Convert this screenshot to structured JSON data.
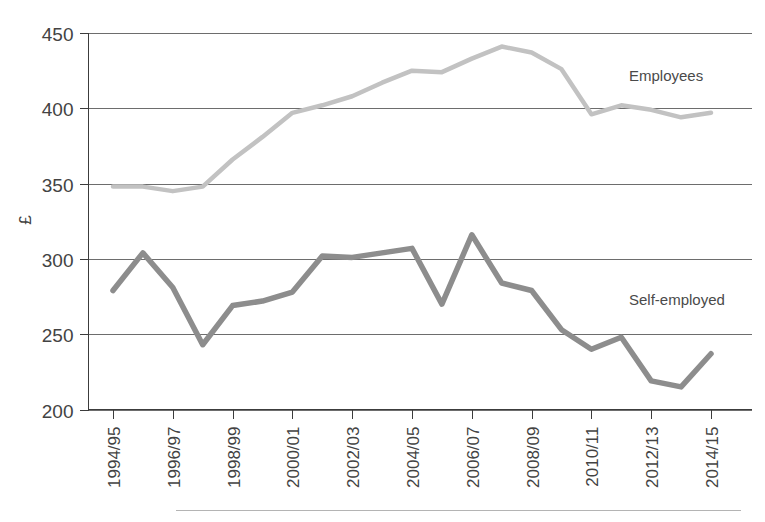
{
  "chart_data": {
    "type": "line",
    "title": "",
    "xlabel": "",
    "ylabel": "£",
    "ylim": [
      200,
      450
    ],
    "yticks": [
      200,
      250,
      300,
      350,
      400,
      450
    ],
    "grid": true,
    "legend_position": "inline-right",
    "x": [
      "1994/95",
      "1995/96",
      "1996/97",
      "1997/98",
      "1998/99",
      "1999/00",
      "2000/01",
      "2001/02",
      "2002/03",
      "2003/04",
      "2004/05",
      "2005/06",
      "2006/07",
      "2007/08",
      "2008/09",
      "2009/10",
      "2010/11",
      "2011/12",
      "2012/13",
      "2013/14",
      "2014/15"
    ],
    "xtick_labels": [
      "1994/95",
      "1996/97",
      "1998/99",
      "2000/01",
      "2002/03",
      "2004/05",
      "2006/07",
      "2008/09",
      "2010/11",
      "2012/13",
      "2014/15"
    ],
    "series": [
      {
        "name": "Employees",
        "color": "#c2c2c2",
        "stroke_width": 4.5,
        "values": [
          348,
          348,
          345,
          348,
          366,
          381,
          397,
          402,
          408,
          417,
          425,
          424,
          433,
          441,
          437,
          426,
          396,
          402,
          399,
          394,
          397
        ]
      },
      {
        "name": "Self-employed",
        "color": "#8d8d8d",
        "stroke_width": 5.5,
        "values": [
          279,
          304,
          281,
          243,
          269,
          272,
          278,
          302,
          301,
          304,
          307,
          270,
          316,
          284,
          279,
          253,
          240,
          248,
          219,
          215,
          237
        ]
      }
    ]
  },
  "annotations": {
    "employees_label": "Employees",
    "self_employed_label": "Self-employed"
  },
  "axis": {
    "y_unit_symbol": "£"
  }
}
